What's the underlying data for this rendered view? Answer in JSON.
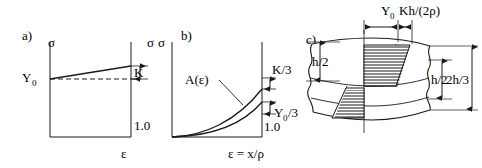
{
  "figure": {
    "type": "technical-diagram",
    "stroke_color": "#1a1a1a",
    "background_color": "#ffffff",
    "hatch_color": "#000000"
  },
  "panels": {
    "a": {
      "tag": "a)",
      "y_axis_label": "σ",
      "x_axis_label": "ε",
      "y_intercept_label": "Y",
      "y_intercept_sub": "0",
      "bracket_label": "K",
      "x_tick_label": "1.0",
      "right_axis_label": "σ",
      "curve": {
        "kind": "linear-hardening",
        "start_value": 0.42,
        "end_value": 0.72,
        "dashed_reference_value": 0.42
      }
    },
    "b": {
      "tag": "b)",
      "y_axis_label": "σ",
      "x_axis_label": "ε = x/ρ",
      "curve_label": "A(ε)",
      "upper_bracket_label": "K/3",
      "lower_bracket_label_main": "Y",
      "lower_bracket_label_sub": "0",
      "lower_bracket_label_tail": "/3",
      "x_tick_label": "1.0",
      "curves": [
        {
          "name": "outer",
          "kind": "power-law",
          "end_value": 0.7
        },
        {
          "name": "inner",
          "kind": "power-law",
          "end_value": 0.56
        }
      ]
    },
    "c": {
      "tag": "c)",
      "top_dim_left_main": "Y",
      "top_dim_left_sub": "0",
      "top_dim_right": "Kh/(2ρ)",
      "left_dim_label": "h/2",
      "right_dim_inner": "h/2",
      "right_dim_outer": "2h/3",
      "description": "Beam section with broken (torn) ends and two hatched trapezoidal stress blocks, antisymmetric about the neutral axis"
    }
  }
}
